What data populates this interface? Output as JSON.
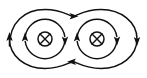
{
  "figure": {
    "title": "Magnetic field lines of two parallel conductors carrying current into the page",
    "background_color": "#ffffff",
    "stroke_color": "#101010",
    "width": 147,
    "height": 78
  },
  "conductors": [
    {
      "id": "left",
      "symbol": "into-page",
      "symbol_glyph": "⊗",
      "label": "",
      "center_x": 45,
      "center_y": 39,
      "radius": 7
    },
    {
      "id": "right",
      "symbol": "into-page",
      "symbol_glyph": "⊗",
      "label": "",
      "center_x": 97,
      "center_y": 39,
      "radius": 7
    }
  ],
  "field_lines": [
    {
      "id": "left-inner-loop",
      "shape": "circle",
      "center_x": 45,
      "center_y": 39,
      "radius": 20,
      "direction": "clockwise",
      "arrows": [
        {
          "position": "left",
          "points": "up"
        },
        {
          "position": "right",
          "points": "down"
        }
      ]
    },
    {
      "id": "right-inner-loop",
      "shape": "circle",
      "center_x": 97,
      "center_y": 39,
      "radius": 20,
      "direction": "clockwise",
      "arrows": [
        {
          "position": "left",
          "points": "up"
        },
        {
          "position": "right",
          "points": "down"
        }
      ]
    },
    {
      "id": "outer-figure-eight-loop",
      "shape": "peanut",
      "direction": "clockwise",
      "arrows": [
        {
          "position": "top-center",
          "points": "right"
        },
        {
          "position": "bottom-center",
          "points": "left"
        },
        {
          "position": "far-left",
          "points": "up"
        },
        {
          "position": "far-right",
          "points": "down"
        }
      ]
    }
  ],
  "legend": {
    "into_page_symbol": "⊗",
    "into_page_meaning": "current into the page",
    "circulation": "clockwise"
  }
}
